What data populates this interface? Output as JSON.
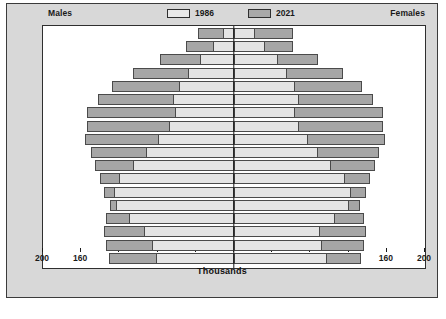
{
  "header": {
    "males_label": "Males",
    "females_label": "Females"
  },
  "legend": [
    {
      "label": "1986",
      "color": "#e4e4e4"
    },
    {
      "label": "2021",
      "color": "#a6a6a6"
    }
  ],
  "axis": {
    "title": "Thousands",
    "ticks": [
      "200",
      "160",
      "120",
      "80",
      "40",
      "0",
      "40",
      "80",
      "120",
      "160",
      "200"
    ]
  },
  "chart_data": {
    "type": "bar",
    "subtype": "population-pyramid",
    "title": "",
    "xlabel": "Thousands",
    "ylabel": "",
    "xlim": [
      -200,
      200
    ],
    "xtick_values": [
      -200,
      -160,
      -120,
      -80,
      -40,
      0,
      40,
      80,
      120,
      160,
      200
    ],
    "xtick_labels": [
      "200",
      "160",
      "120",
      "80",
      "40",
      "0",
      "40",
      "80",
      "120",
      "160",
      "200"
    ],
    "grid": false,
    "legend_position": "top-center",
    "units": "thousands",
    "left_side": "Males",
    "right_side": "Females",
    "categories": [
      "0-4",
      "5-9",
      "10-14",
      "15-19",
      "20-24",
      "25-29",
      "30-34",
      "35-39",
      "40-44",
      "45-49",
      "50-54",
      "55-59",
      "60-64",
      "65-69",
      "70-74",
      "75-79",
      "80-84",
      "85+"
    ],
    "series": [
      {
        "name": "1986",
        "males": [
          82,
          86,
          94,
          110,
          124,
          126,
          120,
          106,
          92,
          80,
          68,
          62,
          64,
          58,
          48,
          36,
          22,
          12
        ],
        "females": [
          97,
          92,
          90,
          106,
          120,
          122,
          116,
          102,
          88,
          78,
          68,
          64,
          68,
          64,
          56,
          46,
          32,
          22
        ]
      },
      {
        "name": "2021",
        "males": [
          131,
          134,
          136,
          134,
          130,
          136,
          140,
          146,
          150,
          156,
          154,
          154,
          142,
          128,
          106,
          78,
          50,
          38
        ],
        "females": [
          133,
          136,
          138,
          136,
          132,
          138,
          142,
          148,
          152,
          158,
          156,
          156,
          146,
          134,
          114,
          88,
          62,
          62
        ]
      }
    ]
  }
}
